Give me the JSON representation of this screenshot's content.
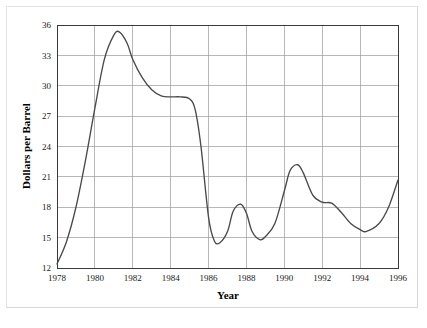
{
  "chart_data": {
    "type": "line",
    "title": "",
    "xlabel": "Year",
    "ylabel": "Dollars per Barrel",
    "xlim": [
      1978,
      1996
    ],
    "ylim": [
      12,
      36
    ],
    "grid": true,
    "legend": "none",
    "x_ticks": [
      1978,
      1980,
      1982,
      1984,
      1986,
      1988,
      1990,
      1992,
      1994,
      1996
    ],
    "y_ticks": [
      12,
      15,
      18,
      21,
      24,
      27,
      30,
      33,
      36
    ],
    "line_color": "#4a4a4a",
    "series": [
      {
        "name": "Crude Oil Price",
        "x": [
          1978.0,
          1978.5,
          1979.0,
          1979.5,
          1980.0,
          1980.5,
          1981.0,
          1981.3,
          1981.7,
          1982.0,
          1982.5,
          1983.0,
          1983.5,
          1984.0,
          1984.5,
          1985.0,
          1985.3,
          1985.6,
          1986.0,
          1986.3,
          1986.6,
          1987.0,
          1987.3,
          1987.7,
          1988.0,
          1988.3,
          1988.7,
          1989.0,
          1989.5,
          1990.0,
          1990.3,
          1990.7,
          1991.0,
          1991.5,
          1992.0,
          1992.5,
          1993.0,
          1993.5,
          1994.0,
          1994.3,
          1995.0,
          1995.5,
          1996.0
        ],
        "y": [
          12.4,
          14.6,
          18.0,
          22.6,
          27.8,
          32.6,
          35.0,
          35.3,
          34.2,
          32.6,
          30.8,
          29.6,
          29.0,
          28.9,
          28.9,
          28.7,
          27.6,
          24.0,
          17.0,
          14.7,
          14.5,
          15.6,
          17.6,
          18.3,
          17.4,
          15.6,
          14.8,
          15.1,
          16.4,
          19.6,
          21.6,
          22.2,
          21.4,
          19.2,
          18.5,
          18.4,
          17.5,
          16.4,
          15.8,
          15.6,
          16.4,
          18.0,
          20.7
        ]
      }
    ]
  },
  "axes": {
    "y_title": "Dollars per Barrel",
    "x_title": "Year",
    "x_tick_labels": [
      "1978",
      "1980",
      "1982",
      "1984",
      "1986",
      "1988",
      "1990",
      "1992",
      "1994",
      "1996"
    ],
    "y_tick_labels": [
      "12",
      "15",
      "18",
      "21",
      "24",
      "27",
      "30",
      "33",
      "36"
    ]
  }
}
